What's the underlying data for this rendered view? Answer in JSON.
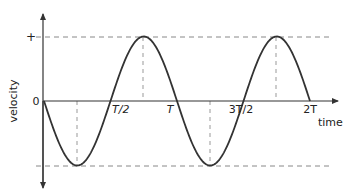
{
  "diagram": {
    "type": "graph",
    "axes": {
      "y_label": "velocity",
      "x_label": "time",
      "y_ticks": {
        "plus": "+",
        "zero": "0"
      }
    },
    "x_ticks": [
      {
        "label": "T/2",
        "x": 110
      },
      {
        "label": "T",
        "x": 176
      },
      {
        "label": "3T/2",
        "x": 243
      },
      {
        "label": "2T",
        "x": 310
      }
    ],
    "colors": {
      "curve": "#333333",
      "axis": "#333333",
      "dashed": "#888888"
    }
  },
  "chart_data": {
    "type": "line",
    "title": "",
    "xlabel": "time",
    "ylabel": "velocity",
    "x_tick_labels": [
      "T/2",
      "T",
      "3T/2",
      "2T"
    ],
    "y_tick_labels": [
      "+",
      "0"
    ],
    "series": [
      {
        "name": "velocity",
        "function": "-v_max * sin(2*pi*t/T)",
        "x": [
          "0",
          "T/4",
          "T/2",
          "3T/4",
          "T",
          "5T/4",
          "3T/2",
          "7T/4",
          "2T"
        ],
        "values": [
          0,
          -1,
          0,
          1,
          0,
          -1,
          0,
          1,
          0
        ]
      }
    ],
    "grid": false,
    "reference_lines": [
      "dashed +v_max",
      "dashed -v_max",
      "dashed verticals at T/4, 3T/4, 5T/4, 7T/4"
    ]
  }
}
